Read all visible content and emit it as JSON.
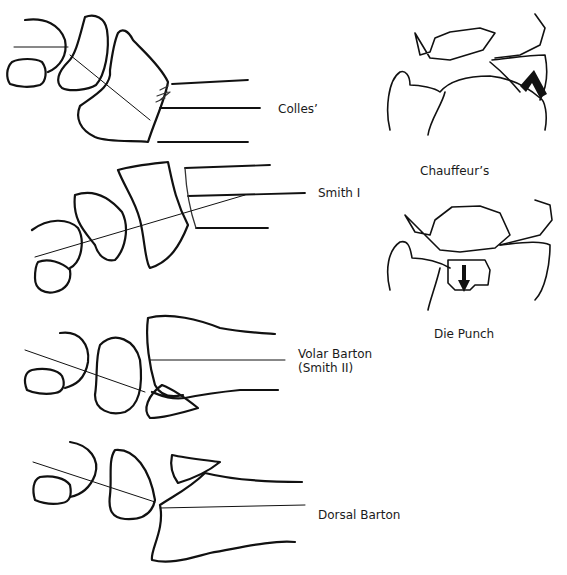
{
  "figure": {
    "colors": {
      "ink": "#111111",
      "background": "#ffffff"
    }
  },
  "labels": {
    "colles": "Colles’",
    "smith1": "Smith I",
    "volar_barton_line1": "Volar Barton",
    "volar_barton_line2": "(Smith II)",
    "dorsal_barton": "Dorsal Barton",
    "chauffeur": "Chauffeur’s",
    "die_punch": "Die Punch"
  }
}
